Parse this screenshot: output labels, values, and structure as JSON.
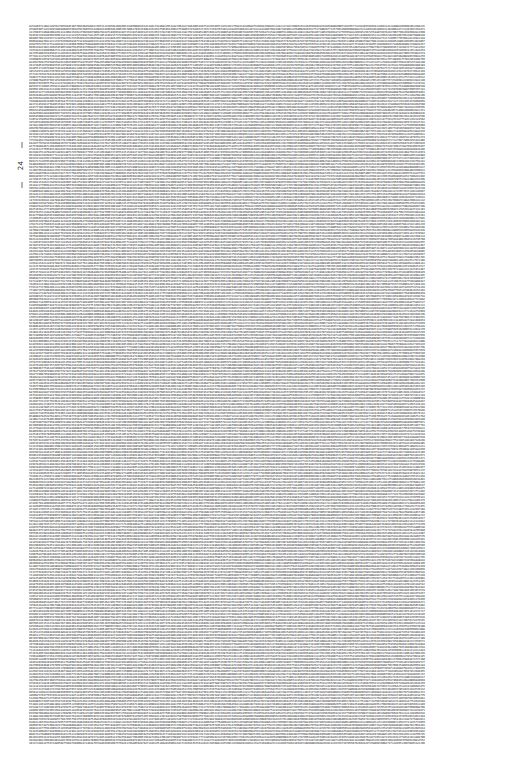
{
  "page": {
    "width": 526,
    "height": 783,
    "background_color": "#ffffff",
    "text_color": "#111111"
  },
  "margin_marker": {
    "label": "24",
    "orientation": "rotated-vertical",
    "position": "left-margin"
  },
  "digit_block": {
    "description": "Dense fully-justified block of numeric digits filling the page",
    "left": 29,
    "top": 25,
    "right": 504,
    "bottom": 746,
    "line_count": 240,
    "chars_per_line": 252,
    "alphabet": "0123456789",
    "font_size_px": 2.62,
    "line_height_px": 3.01,
    "seed": 20240624,
    "lines": []
  }
}
